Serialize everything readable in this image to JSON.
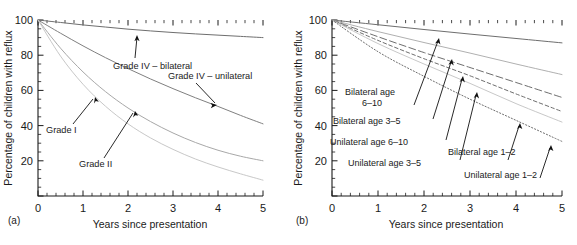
{
  "figure": {
    "panel_a_tag": "(a)",
    "panel_b_tag": "(b)"
  },
  "axes": {
    "ylabel": "Percentage of children with reflux",
    "xlabel": "Years since presentation",
    "y_ticks": [
      "0",
      "20",
      "40",
      "60",
      "80",
      "100"
    ],
    "x_ticks": [
      "0",
      "1",
      "2",
      "3",
      "4",
      "5"
    ]
  },
  "labels_a": {
    "grade4_bilateral": "Grade IV – bilateral",
    "grade4_unilateral": "Grade IV – unilateral",
    "grade1": "Grade I",
    "grade2": "Grade II"
  },
  "labels_b": {
    "bilateral_6_10_line1": "Bilateral age",
    "bilateral_6_10_line2": "6–10",
    "bilateral_3_5": "Bilateral age 3–5",
    "unilateral_6_10": "Unilateral age 6–10",
    "unilateral_3_5": "Unilateral age 3–5",
    "bilateral_1_2": "Bilateral age 1–2",
    "unilateral_1_2": "Unilateral age 1–2"
  },
  "chart_data": [
    {
      "type": "line",
      "panel": "(a)",
      "title": "",
      "xlabel": "Years since presentation",
      "ylabel": "Percentage of children with reflux",
      "xlim": [
        0,
        5
      ],
      "ylim": [
        0,
        100
      ],
      "xticks": [
        0,
        1,
        2,
        3,
        4,
        5
      ],
      "yticks": [
        0,
        20,
        40,
        60,
        80,
        100
      ],
      "x_minor_step": 0.2,
      "y_minor_step": 5,
      "grid": false,
      "legend": "none-annotations-inline",
      "x": [
        0,
        0.5,
        1,
        1.5,
        2,
        2.5,
        3,
        3.5,
        4,
        4.5,
        5
      ],
      "series": [
        {
          "name": "Grade IV – bilateral",
          "style": "solid",
          "color": "#6e6e6e",
          "values": [
            100,
            98.6,
            97.2,
            96.0,
            94.8,
            93.8,
            92.9,
            92.1,
            91.4,
            90.7,
            90.0
          ]
        },
        {
          "name": "Grade IV – unilateral",
          "style": "solid",
          "color": "#808080",
          "values": [
            100,
            92.5,
            85.3,
            78.6,
            72.4,
            66.5,
            61.0,
            55.8,
            50.9,
            45.8,
            41.0
          ]
        },
        {
          "name": "Grade I",
          "style": "solid",
          "color": "#a8a8a8",
          "values": [
            100,
            84.0,
            70.5,
            59.3,
            50.0,
            42.3,
            35.8,
            30.4,
            26.0,
            22.6,
            20.0
          ]
        },
        {
          "name": "Grade II",
          "style": "solid",
          "color": "#c8c8c8",
          "values": [
            100,
            79.5,
            63.5,
            51.0,
            41.0,
            33.0,
            26.5,
            21.0,
            16.5,
            12.6,
            9.0
          ]
        }
      ]
    },
    {
      "type": "line",
      "panel": "(b)",
      "title": "",
      "xlabel": "Years since presentation",
      "ylabel": "Percentage of children with reflux",
      "xlim": [
        0,
        5
      ],
      "ylim": [
        0,
        100
      ],
      "xticks": [
        0,
        1,
        2,
        3,
        4,
        5
      ],
      "yticks": [
        0,
        20,
        40,
        60,
        80,
        100
      ],
      "x_minor_step": 0.2,
      "y_minor_step": 5,
      "grid": false,
      "legend": "none-annotations-inline",
      "x": [
        0,
        1,
        2,
        3,
        4,
        5
      ],
      "series": [
        {
          "name": "Bilateral age 6–10",
          "style": "solid",
          "color": "#6e6e6e",
          "values": [
            100,
            97.3,
            94.6,
            92.0,
            89.5,
            87.0
          ]
        },
        {
          "name": "Bilateral age 3–5",
          "style": "solid",
          "color": "#b0b0b0",
          "values": [
            100,
            93.4,
            87.2,
            81.2,
            75.0,
            69.0
          ]
        },
        {
          "name": "Unilateral age 6–10",
          "style": "long-dash",
          "color": "#6e6e6e",
          "values": [
            100,
            90.5,
            81.5,
            73.0,
            64.5,
            56.0
          ]
        },
        {
          "name": "Unilateral age 3–5",
          "style": "dashed",
          "color": "#6e6e6e",
          "values": [
            100,
            88.4,
            78.0,
            68.3,
            58.0,
            48.0
          ]
        },
        {
          "name": "Bilateral age 1–2",
          "style": "solid",
          "color": "#c8c8c8",
          "values": [
            100,
            86.6,
            75.0,
            64.0,
            52.5,
            42.0
          ]
        },
        {
          "name": "Unilateral age 1–2",
          "style": "dotted",
          "color": "#6e6e6e",
          "values": [
            100,
            82.0,
            68.0,
            55.0,
            43.0,
            31.0
          ]
        }
      ]
    }
  ]
}
